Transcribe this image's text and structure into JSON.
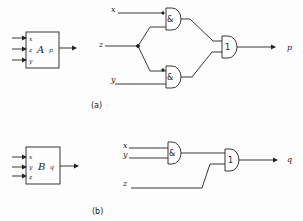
{
  "figure_a": {
    "caption": "(a)",
    "block": {
      "name": "A",
      "inputs": [
        "x",
        "z",
        "y"
      ],
      "output": "p"
    },
    "inputs": {
      "x": "x",
      "z": "z",
      "y": "y"
    },
    "gates": {
      "and_top": "&",
      "and_bottom": "&",
      "or": "1"
    },
    "output": "p"
  },
  "figure_b": {
    "caption": "(b)",
    "block": {
      "name": "B",
      "inputs": [
        "x",
        "y",
        "z"
      ],
      "output": "q"
    },
    "inputs": {
      "x": "x",
      "y": "y",
      "z": "z"
    },
    "gates": {
      "and": "&",
      "or": "1"
    },
    "output": "q"
  },
  "colors": {
    "ink": "#222222",
    "background": "#fdfdfd"
  }
}
